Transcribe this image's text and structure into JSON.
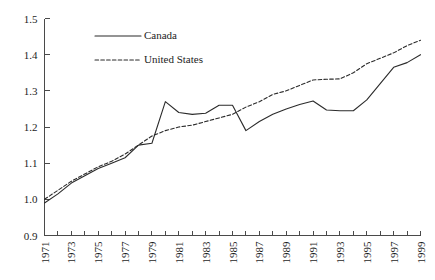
{
  "chart_data": {
    "type": "line",
    "title": "",
    "subtitle": "",
    "xlabel": "",
    "ylabel": "",
    "xlim": [
      1971,
      1999
    ],
    "ylim": [
      0.9,
      1.5
    ],
    "grid": false,
    "legend_position": "upper-left-inside",
    "y_ticks": [
      "0.9",
      "1.0",
      "1.1",
      "1.2",
      "1.3",
      "1.4",
      "1.5"
    ],
    "y_tick_values": [
      0.9,
      1.0,
      1.1,
      1.2,
      1.3,
      1.4,
      1.5
    ],
    "x_tick_values": [
      1971,
      1972,
      1973,
      1974,
      1975,
      1976,
      1977,
      1978,
      1979,
      1980,
      1981,
      1982,
      1983,
      1984,
      1985,
      1986,
      1987,
      1988,
      1989,
      1990,
      1991,
      1992,
      1993,
      1994,
      1995,
      1996,
      1997,
      1998,
      1999
    ],
    "x_tick_labels": [
      "1971",
      "",
      "1973",
      "",
      "1975",
      "",
      "1977",
      "",
      "1979",
      "",
      "1981",
      "",
      "1983",
      "",
      "1985",
      "",
      "1987",
      "",
      "1989",
      "",
      "1991",
      "",
      "1993",
      "",
      "1995",
      "",
      "1997",
      "",
      "1999"
    ],
    "x": [
      1971,
      1972,
      1973,
      1974,
      1975,
      1976,
      1977,
      1978,
      1979,
      1980,
      1981,
      1982,
      1983,
      1984,
      1985,
      1986,
      1987,
      1988,
      1989,
      1990,
      1991,
      1992,
      1993,
      1994,
      1995,
      1996,
      1997,
      1998,
      1999
    ],
    "series": [
      {
        "name": "Canada",
        "style": "solid",
        "color": "#2b2b2b",
        "values": [
          0.99,
          1.015,
          1.045,
          1.065,
          1.085,
          1.1,
          1.115,
          1.15,
          1.155,
          1.27,
          1.24,
          1.235,
          1.238,
          1.26,
          1.26,
          1.19,
          1.215,
          1.235,
          1.25,
          1.262,
          1.272,
          1.247,
          1.245,
          1.245,
          1.275,
          1.32,
          1.365,
          1.378,
          1.4
        ]
      },
      {
        "name": "United States",
        "style": "dashed",
        "color": "#2b2b2b",
        "values": [
          1.0,
          1.025,
          1.05,
          1.07,
          1.09,
          1.105,
          1.125,
          1.15,
          1.175,
          1.19,
          1.2,
          1.205,
          1.215,
          1.225,
          1.235,
          1.255,
          1.27,
          1.29,
          1.3,
          1.315,
          1.33,
          1.332,
          1.333,
          1.35,
          1.375,
          1.39,
          1.405,
          1.425,
          1.44
        ]
      }
    ]
  },
  "legend": {
    "entries": [
      {
        "label": "Canada",
        "style": "solid"
      },
      {
        "label": "United States",
        "style": "dashed"
      }
    ]
  }
}
